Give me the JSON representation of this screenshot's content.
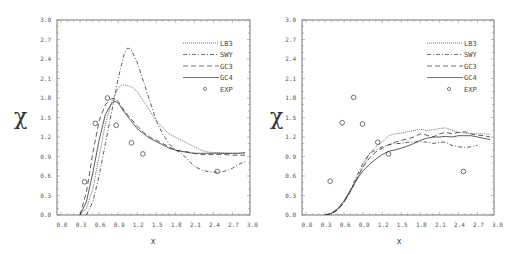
{
  "chart_data": [
    {
      "type": "line",
      "panel": "left",
      "title": "",
      "xlabel": "x",
      "ylabel": "χ",
      "xlim": [
        0.0,
        3.0
      ],
      "ylim": [
        0.0,
        3.0
      ],
      "xticks": [
        "0.0",
        "0.3",
        "0.6",
        "0.9",
        "1.2",
        "1.5",
        "1.8",
        "2.1",
        "2.4",
        "2.7",
        "3.0"
      ],
      "yticks": [
        "0.0",
        "0.3",
        "0.6",
        "0.9",
        "1.2",
        "1.5",
        "1.8",
        "2.1",
        "2.4",
        "2.7",
        "3.0"
      ],
      "grid": false,
      "legend_position": "upper right",
      "series": [
        {
          "name": "LB3",
          "style": "dotted",
          "x": [
            0.3,
            0.4,
            0.5,
            0.6,
            0.7,
            0.8,
            0.9,
            0.95,
            1.0,
            1.1,
            1.2,
            1.3,
            1.4,
            1.5,
            1.6,
            1.7,
            1.8,
            1.9,
            2.0,
            2.1,
            2.2,
            2.3,
            2.4,
            2.5,
            2.6,
            2.7,
            2.8,
            2.9
          ],
          "y": [
            0.0,
            0.1,
            0.4,
            0.9,
            1.4,
            1.75,
            1.95,
            2.0,
            2.0,
            1.98,
            1.9,
            1.75,
            1.6,
            1.45,
            1.35,
            1.25,
            1.2,
            1.15,
            1.1,
            1.05,
            1.0,
            0.97,
            0.96,
            0.96,
            0.95,
            0.95,
            0.95,
            0.95
          ]
        },
        {
          "name": "SWY",
          "style": "dashdot",
          "x": [
            0.4,
            0.5,
            0.6,
            0.7,
            0.8,
            0.9,
            1.0,
            1.05,
            1.1,
            1.2,
            1.3,
            1.4,
            1.5,
            1.6,
            1.7,
            1.8,
            1.9,
            2.0,
            2.1,
            2.2,
            2.3,
            2.4,
            2.5,
            2.6,
            2.7,
            2.8,
            2.9
          ],
          "y": [
            0.0,
            0.2,
            0.6,
            1.1,
            1.6,
            2.1,
            2.5,
            2.57,
            2.55,
            2.35,
            2.05,
            1.75,
            1.45,
            1.25,
            1.1,
            1.0,
            0.95,
            0.85,
            0.75,
            0.7,
            0.67,
            0.66,
            0.66,
            0.68,
            0.72,
            0.78,
            0.82
          ]
        },
        {
          "name": "GC3",
          "style": "dashed",
          "x": [
            0.3,
            0.4,
            0.5,
            0.6,
            0.7,
            0.8,
            0.85,
            0.9,
            1.0,
            1.1,
            1.2,
            1.3,
            1.4,
            1.5,
            1.6,
            1.7,
            1.8,
            1.9,
            2.0,
            2.1,
            2.2,
            2.3,
            2.4,
            2.5,
            2.6,
            2.7,
            2.8,
            2.9
          ],
          "y": [
            0.0,
            0.35,
            0.95,
            1.45,
            1.7,
            1.79,
            1.79,
            1.75,
            1.6,
            1.48,
            1.37,
            1.27,
            1.2,
            1.15,
            1.1,
            1.05,
            1.0,
            0.98,
            0.97,
            0.95,
            0.93,
            0.93,
            0.93,
            0.93,
            0.93,
            0.92,
            0.92,
            0.92
          ]
        },
        {
          "name": "GC4",
          "style": "solid",
          "x": [
            0.3,
            0.4,
            0.5,
            0.6,
            0.7,
            0.8,
            0.85,
            0.9,
            1.0,
            1.1,
            1.2,
            1.3,
            1.4,
            1.5,
            1.6,
            1.7,
            1.8,
            1.9,
            2.0,
            2.1,
            2.2,
            2.3,
            2.4,
            2.5,
            2.6,
            2.7,
            2.8,
            2.9
          ],
          "y": [
            0.0,
            0.2,
            0.65,
            1.15,
            1.55,
            1.72,
            1.75,
            1.72,
            1.58,
            1.45,
            1.33,
            1.25,
            1.18,
            1.13,
            1.08,
            1.03,
            1.0,
            0.98,
            0.96,
            0.95,
            0.95,
            0.95,
            0.95,
            0.95,
            0.95,
            0.95,
            0.95,
            0.96
          ]
        },
        {
          "name": "EXP",
          "style": "circle",
          "x": [
            0.37,
            0.54,
            0.73,
            0.87,
            1.11,
            1.29,
            2.46
          ],
          "y": [
            0.51,
            1.41,
            1.8,
            1.38,
            1.11,
            0.94,
            0.67
          ]
        }
      ]
    },
    {
      "type": "line",
      "panel": "right",
      "title": "",
      "xlabel": "x",
      "ylabel": "χ",
      "xlim": [
        0.0,
        3.0
      ],
      "ylim": [
        0.0,
        3.0
      ],
      "xticks": [
        "0.0",
        "0.3",
        "0.6",
        "0.9",
        "1.2",
        "1.5",
        "1.8",
        "2.1",
        "2.4",
        "2.7",
        "3.0"
      ],
      "yticks": [
        "0.0",
        "0.3",
        "0.6",
        "0.9",
        "1.2",
        "1.5",
        "1.8",
        "2.1",
        "2.4",
        "2.7",
        "3.0"
      ],
      "grid": false,
      "legend_position": "upper right",
      "series": [
        {
          "name": "LB3",
          "style": "dotted",
          "x": [
            0.3,
            0.4,
            0.5,
            0.6,
            0.7,
            0.8,
            0.9,
            1.0,
            1.1,
            1.2,
            1.3,
            1.4,
            1.5,
            1.6,
            1.7,
            1.8,
            1.9,
            2.0,
            2.1,
            2.2,
            2.3,
            2.4,
            2.5,
            2.6,
            2.7,
            2.8,
            2.9
          ],
          "y": [
            0.0,
            0.02,
            0.08,
            0.2,
            0.35,
            0.55,
            0.75,
            0.95,
            1.05,
            1.12,
            1.22,
            1.25,
            1.26,
            1.28,
            1.3,
            1.32,
            1.3,
            1.31,
            1.33,
            1.34,
            1.3,
            1.27,
            1.26,
            1.25,
            1.25,
            1.25,
            1.24
          ]
        },
        {
          "name": "SWY",
          "style": "dashdot",
          "x": [
            0.3,
            0.4,
            0.5,
            0.6,
            0.7,
            0.8,
            0.9,
            1.0,
            1.1,
            1.2,
            1.3,
            1.4,
            1.5,
            1.6,
            1.7,
            1.8,
            1.9,
            2.0,
            2.1,
            2.2,
            2.3,
            2.4,
            2.5,
            2.6,
            2.7
          ],
          "y": [
            0.0,
            0.02,
            0.08,
            0.2,
            0.38,
            0.6,
            0.8,
            0.95,
            1.0,
            1.05,
            1.08,
            1.1,
            1.1,
            1.12,
            1.12,
            1.13,
            1.12,
            1.1,
            1.12,
            1.12,
            1.07,
            1.05,
            1.04,
            1.05,
            1.07
          ]
        },
        {
          "name": "GC3",
          "style": "dashed",
          "x": [
            0.3,
            0.4,
            0.5,
            0.6,
            0.7,
            0.8,
            0.9,
            1.0,
            1.1,
            1.2,
            1.3,
            1.4,
            1.5,
            1.6,
            1.7,
            1.8,
            1.9,
            2.0,
            2.1,
            2.2,
            2.3,
            2.4,
            2.5,
            2.6,
            2.7,
            2.8,
            2.9
          ],
          "y": [
            0.0,
            0.02,
            0.08,
            0.2,
            0.36,
            0.56,
            0.74,
            0.88,
            0.97,
            1.03,
            1.08,
            1.12,
            1.15,
            1.17,
            1.2,
            1.25,
            1.23,
            1.2,
            1.25,
            1.27,
            1.25,
            1.27,
            1.28,
            1.25,
            1.23,
            1.22,
            1.2
          ]
        },
        {
          "name": "GC4",
          "style": "solid",
          "x": [
            0.3,
            0.4,
            0.5,
            0.6,
            0.7,
            0.8,
            0.9,
            1.0,
            1.1,
            1.2,
            1.3,
            1.4,
            1.5,
            1.6,
            1.7,
            1.8,
            1.9,
            2.0,
            2.1,
            2.2,
            2.3,
            2.4,
            2.5,
            2.6,
            2.7,
            2.8,
            2.9
          ],
          "y": [
            0.0,
            0.03,
            0.1,
            0.22,
            0.38,
            0.55,
            0.68,
            0.78,
            0.86,
            0.93,
            0.98,
            1.0,
            1.03,
            1.06,
            1.1,
            1.15,
            1.18,
            1.2,
            1.2,
            1.21,
            1.2,
            1.22,
            1.22,
            1.22,
            1.2,
            1.18,
            1.16
          ]
        },
        {
          "name": "EXP",
          "style": "circle",
          "x": [
            0.38,
            0.57,
            0.75,
            0.89,
            1.13,
            1.3,
            2.48
          ],
          "y": [
            0.52,
            1.42,
            1.81,
            1.4,
            1.12,
            0.94,
            0.67
          ]
        }
      ]
    }
  ],
  "panels": [
    {
      "id": "left",
      "xlabel": "x",
      "ylabel": "χ"
    },
    {
      "id": "right",
      "xlabel": "x",
      "ylabel": "χ"
    }
  ],
  "legend": {
    "entries": [
      {
        "label": "LB3",
        "style": "dotted"
      },
      {
        "label": "SWY",
        "style": "dashdot"
      },
      {
        "label": "GC3",
        "style": "dashed"
      },
      {
        "label": "GC4",
        "style": "solid"
      },
      {
        "label": "EXP",
        "style": "circle"
      }
    ]
  },
  "colors": {
    "line": "#333333",
    "frame": "#555555",
    "text": "#555555",
    "background": "#ffffff"
  }
}
